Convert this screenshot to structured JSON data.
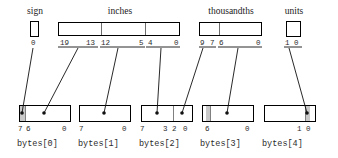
{
  "diagram": {
    "colors": {
      "outline": "#000000",
      "shade": "#c9c9c9",
      "divider": "#6d6d6d",
      "text": "#2b2b2b",
      "wire": "#111111"
    }
  },
  "fields": [
    {
      "key": "sign",
      "caption": "sign",
      "box": {
        "x": 30,
        "y": 21,
        "w": 9,
        "h": 16
      },
      "dividers": [],
      "bits": [
        {
          "label": "0",
          "x": 31,
          "y": 39
        }
      ]
    },
    {
      "key": "inches",
      "caption": "inches",
      "box": {
        "x": 58,
        "y": 22,
        "w": 122,
        "h": 14
      },
      "dividers": [
        42,
        86
      ],
      "bits": [
        {
          "label": "19",
          "x": 60,
          "y": 39
        },
        {
          "label": "13",
          "x": 86,
          "y": 39
        },
        {
          "label": "12",
          "x": 101,
          "y": 39
        },
        {
          "label": "5",
          "x": 139,
          "y": 39
        },
        {
          "label": "4",
          "x": 148,
          "y": 39
        },
        {
          "label": "0",
          "x": 174,
          "y": 39
        }
      ]
    },
    {
      "key": "thousandths",
      "caption": "thousandths",
      "box": {
        "x": 199,
        "y": 22,
        "w": 63,
        "h": 14
      },
      "dividers": [
        19
      ],
      "bits": [
        {
          "label": "9",
          "x": 200,
          "y": 39
        },
        {
          "label": "7",
          "x": 210,
          "y": 39
        },
        {
          "label": "6",
          "x": 219,
          "y": 39
        },
        {
          "label": "0",
          "x": 256,
          "y": 39
        }
      ]
    },
    {
      "key": "units",
      "caption": "units",
      "box": {
        "x": 286,
        "y": 21,
        "w": 15,
        "h": 16
      },
      "dividers": [],
      "bits": [
        {
          "label": "1",
          "x": 285,
          "y": 39
        },
        {
          "label": "0",
          "x": 294,
          "y": 39
        }
      ]
    }
  ],
  "field_captions": [
    {
      "text": "sign",
      "x": 18,
      "y": 6,
      "w": 34
    },
    {
      "text": "inches",
      "x": 100,
      "y": 6,
      "w": 40
    },
    {
      "text": "thousandths",
      "x": 198,
      "y": 6,
      "w": 66
    },
    {
      "text": "units",
      "x": 277,
      "y": 6,
      "w": 34
    }
  ],
  "bytes": [
    {
      "label": "bytes[0]",
      "label_x": 17,
      "label_y": 140,
      "box": {
        "x": 19,
        "y": 105,
        "w": 52,
        "h": 17
      },
      "shade": [
        {
          "x": 0,
          "w": 5
        }
      ],
      "dividers": [
        5
      ],
      "bits": [
        {
          "label": "7",
          "x": 18,
          "y": 125
        },
        {
          "label": "6",
          "x": 26,
          "y": 125
        },
        {
          "label": "0",
          "x": 62,
          "y": 125
        }
      ]
    },
    {
      "label": "bytes[1]",
      "label_x": 78,
      "label_y": 140,
      "box": {
        "x": 79,
        "y": 105,
        "w": 52,
        "h": 17
      },
      "shade": [],
      "dividers": [],
      "bits": [
        {
          "label": "7",
          "x": 79,
          "y": 125
        },
        {
          "label": "0",
          "x": 122,
          "y": 125
        }
      ]
    },
    {
      "label": "bytes[2]",
      "label_x": 139,
      "label_y": 140,
      "box": {
        "x": 141,
        "y": 105,
        "w": 52,
        "h": 17
      },
      "shade": [],
      "dividers": [
        31
      ],
      "bits": [
        {
          "label": "7",
          "x": 140,
          "y": 125
        },
        {
          "label": "3",
          "x": 163,
          "y": 125
        },
        {
          "label": "2",
          "x": 172,
          "y": 125
        },
        {
          "label": "0",
          "x": 183,
          "y": 125
        }
      ]
    },
    {
      "label": "bytes[3]",
      "label_x": 200,
      "label_y": 140,
      "box": {
        "x": 202,
        "y": 105,
        "w": 52,
        "h": 17
      },
      "shade": [
        {
          "x": 3,
          "w": 4
        }
      ],
      "dividers": [
        7
      ],
      "bits": [
        {
          "label": "6",
          "x": 205,
          "y": 125
        },
        {
          "label": "0",
          "x": 245,
          "y": 125
        }
      ]
    },
    {
      "label": "bytes[4]",
      "label_x": 262,
      "label_y": 140,
      "box": {
        "x": 264,
        "y": 105,
        "w": 52,
        "h": 17
      },
      "shade": [
        {
          "x": 40,
          "w": 5
        }
      ],
      "dividers": [
        40
      ],
      "bits": [
        {
          "label": "1",
          "x": 297,
          "y": 125
        },
        {
          "label": "0",
          "x": 306,
          "y": 125
        }
      ]
    }
  ],
  "connectors": [
    {
      "name": "sign-to-byte0-bit7",
      "x1": 33,
      "y1": 48,
      "x2": 22,
      "y2": 113
    },
    {
      "name": "inches-hi-to-byte0",
      "x1": 78,
      "y1": 48,
      "x2": 44,
      "y2": 113
    },
    {
      "name": "inches-mid-to-byte1",
      "x1": 118,
      "y1": 48,
      "x2": 104,
      "y2": 113
    },
    {
      "name": "inches-lo-to-byte2-hi",
      "x1": 161,
      "y1": 48,
      "x2": 157,
      "y2": 113
    },
    {
      "name": "thousandths-hi-to-byte2-lo",
      "x1": 203,
      "y1": 48,
      "x2": 182,
      "y2": 113
    },
    {
      "name": "thousandths-lo-to-byte3",
      "x1": 238,
      "y1": 48,
      "x2": 227,
      "y2": 113
    },
    {
      "name": "units-to-byte4",
      "x1": 289,
      "y1": 48,
      "x2": 307,
      "y2": 113
    }
  ],
  "underlines": [
    {
      "name": "inches-hi-underline",
      "x": 58,
      "y": 47,
      "w": 40
    },
    {
      "name": "inches-mid-underline",
      "x": 100,
      "y": 47,
      "w": 45
    },
    {
      "name": "inches-lo-underline",
      "x": 146,
      "y": 47,
      "w": 34
    },
    {
      "name": "thousand-hi-underline",
      "x": 199,
      "y": 47,
      "w": 17
    },
    {
      "name": "thousand-lo-underline",
      "x": 218,
      "y": 47,
      "w": 44
    },
    {
      "name": "units-underline",
      "x": 284,
      "y": 47,
      "w": 18
    }
  ]
}
